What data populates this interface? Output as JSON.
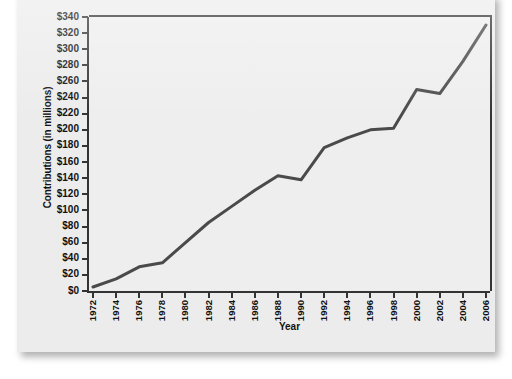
{
  "figure": {
    "title": "",
    "background_color": "#ececec",
    "plot_background_color": "#eeeeee",
    "axis_color": "#333333",
    "line_color": "#4a4a4a"
  },
  "chart_data": {
    "type": "line",
    "title": "",
    "xlabel": "Year",
    "ylabel": "Contributions (in millions)",
    "x": [
      1972,
      1974,
      1976,
      1978,
      1980,
      1982,
      1984,
      1986,
      1988,
      1990,
      1992,
      1994,
      1996,
      1998,
      2000,
      2002,
      2004,
      2006
    ],
    "values": [
      5,
      15,
      30,
      35,
      60,
      85,
      105,
      125,
      143,
      138,
      178,
      190,
      200,
      202,
      250,
      245,
      285,
      330
    ],
    "series": [
      {
        "name": "Contributions",
        "values": [
          5,
          15,
          30,
          35,
          60,
          85,
          105,
          125,
          143,
          138,
          178,
          190,
          200,
          202,
          250,
          245,
          285,
          330
        ]
      }
    ],
    "x_tick_labels": [
      "1972",
      "1974",
      "1976",
      "1978",
      "1980",
      "1982",
      "1984",
      "1986",
      "1988",
      "1990",
      "1992",
      "1994",
      "1996",
      "1998",
      "2000",
      "2002",
      "2004",
      "2006"
    ],
    "y_tick_labels": [
      "$340",
      "$320",
      "$300",
      "$280",
      "$260",
      "$240",
      "$220",
      "$200",
      "$180",
      "$160",
      "$140",
      "$120",
      "$100",
      "$80",
      "$60",
      "$40",
      "$20",
      "$0"
    ],
    "y_tick_values": [
      340,
      320,
      300,
      280,
      260,
      240,
      220,
      200,
      180,
      160,
      140,
      120,
      100,
      80,
      60,
      40,
      20,
      0
    ],
    "xlim": [
      1972,
      2006
    ],
    "ylim": [
      0,
      340
    ],
    "grid": false,
    "legend": "none"
  }
}
